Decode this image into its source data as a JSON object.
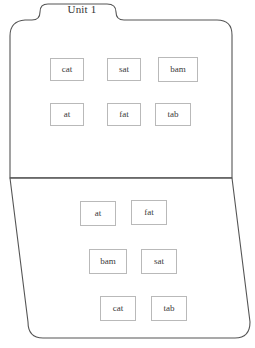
{
  "page": {
    "background_color": "#ffffff",
    "outline_color": "#555555",
    "card_border_color": "#b9b9b9",
    "text_color": "#333333",
    "width": 255,
    "height": 348
  },
  "folder": {
    "tab_label": "Unit 1"
  },
  "top_panel": {
    "name": "top-panel",
    "rows": [
      {
        "cards": [
          {
            "label": "cat",
            "x": 50,
            "y": 58,
            "w": 34,
            "h": 23
          },
          {
            "label": "sat",
            "x": 107,
            "y": 58,
            "w": 34,
            "h": 23
          },
          {
            "label": "bam",
            "x": 158,
            "y": 57,
            "w": 40,
            "h": 25
          }
        ]
      },
      {
        "cards": [
          {
            "label": "at",
            "x": 50,
            "y": 103,
            "w": 34,
            "h": 23
          },
          {
            "label": "fat",
            "x": 107,
            "y": 103,
            "w": 34,
            "h": 23
          },
          {
            "label": "tab",
            "x": 155,
            "y": 103,
            "w": 36,
            "h": 23
          }
        ]
      }
    ]
  },
  "bottom_panel": {
    "name": "bottom-panel",
    "rows": [
      {
        "cards": [
          {
            "label": "at",
            "x": 80,
            "y": 201,
            "w": 36,
            "h": 25
          },
          {
            "label": "fat",
            "x": 131,
            "y": 200,
            "w": 36,
            "h": 25
          }
        ]
      },
      {
        "cards": [
          {
            "label": "bam",
            "x": 89,
            "y": 249,
            "w": 38,
            "h": 25
          },
          {
            "label": "sat",
            "x": 141,
            "y": 249,
            "w": 36,
            "h": 25
          }
        ]
      },
      {
        "cards": [
          {
            "label": "cat",
            "x": 100,
            "y": 296,
            "w": 36,
            "h": 25
          },
          {
            "label": "tab",
            "x": 151,
            "y": 296,
            "w": 36,
            "h": 25
          }
        ]
      }
    ]
  }
}
